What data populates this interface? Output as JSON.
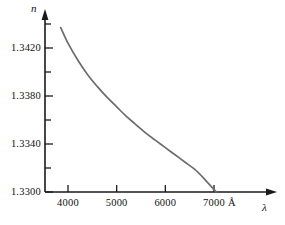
{
  "chart_data": {
    "type": "line",
    "title": "",
    "subtitle": "",
    "xlabel": "λ",
    "ylabel": "n",
    "xunit": "Å",
    "xlim": [
      3450,
      7850
    ],
    "ylim": [
      1.33,
      1.3445
    ],
    "grid": false,
    "legend": null,
    "x_ticks": [
      {
        "value": 4000,
        "label": "4000",
        "major": true
      },
      {
        "value": 5000,
        "label": "5000",
        "major": true
      },
      {
        "value": 6000,
        "label": "6000",
        "major": true
      },
      {
        "value": 7000,
        "label": "7000",
        "major": true
      }
    ],
    "y_ticks": [
      {
        "value": 1.33,
        "label": "1.3300",
        "major": true
      },
      {
        "value": 1.332,
        "label": "",
        "major": false
      },
      {
        "value": 1.334,
        "label": "1.3340",
        "major": true
      },
      {
        "value": 1.336,
        "label": "",
        "major": false
      },
      {
        "value": 1.338,
        "label": "1.3380",
        "major": true
      },
      {
        "value": 1.34,
        "label": "",
        "major": false
      },
      {
        "value": 1.342,
        "label": "1.3420",
        "major": true
      },
      {
        "value": 1.344,
        "label": "",
        "major": false
      }
    ],
    "series": [
      {
        "name": "refractive index",
        "color": "#6d6d6d",
        "x": [
          3850,
          4000,
          4200,
          4400,
          4600,
          4800,
          5000,
          5200,
          5400,
          5600,
          5800,
          6000,
          6200,
          6400,
          6600,
          6800,
          7000,
          7050
        ],
        "y": [
          1.3437,
          1.3424,
          1.341,
          1.3398,
          1.3388,
          1.3379,
          1.3371,
          1.3363,
          1.3356,
          1.3349,
          1.3343,
          1.3337,
          1.3331,
          1.3325,
          1.3319,
          1.3311,
          1.3302,
          1.33
        ]
      }
    ],
    "axis_titles": {
      "y": "n",
      "x": "λ",
      "x_unit": "Å"
    }
  },
  "colors": {
    "axis": "#1a1a1a",
    "curve": "#6d6d6d",
    "text": "#111111",
    "background": "#ffffff"
  }
}
